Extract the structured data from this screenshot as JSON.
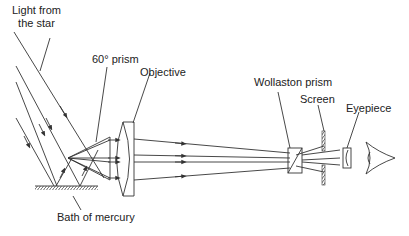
{
  "diagram": {
    "labels": {
      "light_from_star_line1": "Light from",
      "light_from_star_line2": "the star",
      "prism": "60° prism",
      "objective": "Objective",
      "wollaston": "Wollaston prism",
      "screen": "Screen",
      "eyepiece": "Eyepiece",
      "mercury": "Bath of mercury"
    },
    "colors": {
      "line": "#333333",
      "background": "#ffffff"
    }
  }
}
